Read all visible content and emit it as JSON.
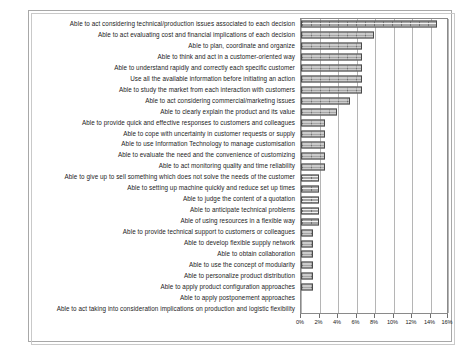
{
  "chart_data": {
    "type": "bar",
    "orientation": "horizontal",
    "title": "",
    "subtitle": "",
    "xlabel": "",
    "ylabel": "",
    "xlim": [
      0,
      16
    ],
    "xunit": "%",
    "grid": true,
    "legend": false,
    "legend_position": "none",
    "xticks": [
      "0%",
      "2%",
      "4%",
      "6%",
      "8%",
      "10%",
      "12%",
      "14%",
      "16%"
    ],
    "xtick_values": [
      0,
      2,
      4,
      6,
      8,
      10,
      12,
      14,
      16
    ],
    "bar_color": "#a6a6a6",
    "bar_edge_color": "#4a4a4a",
    "categories": [
      "Able to act considering technical/production issues associated to each decision",
      "Able to act evaluating cost and financial implications of each decision",
      "Able to plan, coordinate and organize",
      "Able to think and act in a customer-oriented way",
      "Able to understand rapidly and correctly each specific customer",
      "Use all the available information before initiating an action",
      "Able to study the market from each interaction with customers",
      "Able to act considering commercial/marketing issues",
      "Able to clearly explain the product and its value",
      "Able to provide quick and effective responses to customers and colleagues",
      "Able to cope with uncertainty in customer requests or supply",
      "Able to use Information Technology to manage customisation",
      "Able to evaluate the need and the convenience of customizing",
      "Able to act monitoring quality and time reliability",
      "Able to give up to sell something which does not solve the needs of the customer",
      "Able to setting up machine quickly and reduce set up times",
      "Able to judge the content of a quotation",
      "Able to anticipate technical problems",
      "Able of using resources in a flexible way",
      "Able to provide technical support to customers or colleagues",
      "Able to develop flexible supply network",
      "Able to obtain collaboration",
      "Able to use the concept of modularity",
      "Able to personalize product distribution",
      "Able to apply product configuration approaches",
      "Able to apply postponement approaches",
      "Able to act taking into consideration implications on production and logistic flexibility"
    ],
    "values": [
      14.7,
      7.9,
      6.6,
      6.6,
      6.6,
      6.6,
      6.6,
      5.3,
      3.9,
      2.6,
      2.6,
      2.6,
      2.6,
      2.6,
      1.9,
      1.9,
      1.9,
      1.9,
      1.9,
      1.3,
      1.3,
      1.3,
      1.3,
      1.3,
      1.3,
      0,
      0
    ]
  }
}
